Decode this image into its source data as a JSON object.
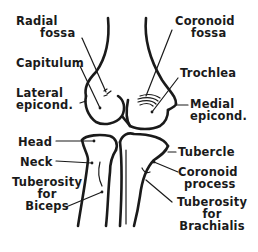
{
  "diagram": {
    "labels": {
      "radial_fossa_1": "Radial",
      "radial_fossa_2": "fossa",
      "coronoid_fossa_1": "Coronoid",
      "coronoid_fossa_2": "fossa",
      "capitulum": "Capitulum",
      "trochlea": "Trochlea",
      "lateral_epicond_1": "Lateral",
      "lateral_epicond_2": "epicond.",
      "medial_epicond_1": "Medial",
      "medial_epicond_2": "epicond.",
      "head": "Head",
      "neck": "Neck",
      "tuberosity_biceps_1": "Tuberosity",
      "tuberosity_biceps_2": "for",
      "tuberosity_biceps_3": "Biceps",
      "tubercle": "Tubercle",
      "coronoid_process_1": "Coronoid",
      "coronoid_process_2": "process",
      "tuberosity_brachialis_1": "Tuberosity",
      "tuberosity_brachialis_2": "for",
      "tuberosity_brachialis_3": "Brachialis"
    },
    "colors": {
      "ink": "#1a1a1a",
      "background": "#ffffff"
    }
  }
}
